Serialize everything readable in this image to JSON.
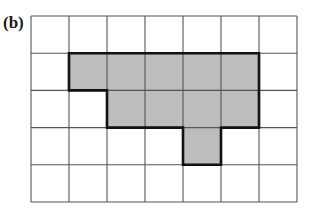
{
  "figure": {
    "label": "(b)",
    "grid": {
      "columns": 7,
      "rows": 5,
      "origin_px": [
        31,
        16
      ],
      "cell_width_px": 38,
      "cell_height_px": 37.2,
      "line_color": "#555555",
      "background": "#ffffff"
    },
    "shape": {
      "fill_color": "#bdbdbd",
      "outline_color": "#111111",
      "shaded_cells": [
        [
          1,
          1
        ],
        [
          1,
          2
        ],
        [
          1,
          3
        ],
        [
          1,
          4
        ],
        [
          1,
          5
        ],
        [
          2,
          2
        ],
        [
          2,
          3
        ],
        [
          2,
          4
        ],
        [
          2,
          5
        ],
        [
          3,
          4
        ]
      ],
      "cell_count": 10
    }
  }
}
